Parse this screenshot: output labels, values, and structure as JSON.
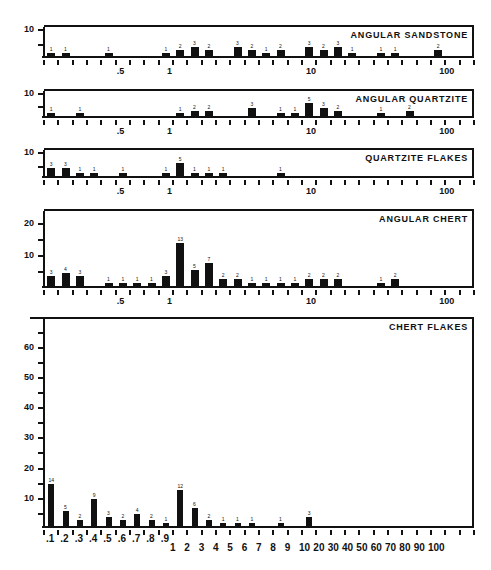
{
  "chart_data": [
    {
      "type": "bar",
      "title": "ANGULAR SANDSTONE",
      "xscale": "log",
      "xtick_labels": [
        ".5",
        "1",
        "10",
        "100"
      ],
      "ylim": [
        0,
        10
      ],
      "yticks": [
        "10"
      ],
      "bars": [
        {
          "slot": 0,
          "value": 1
        },
        {
          "slot": 1,
          "value": 1
        },
        {
          "slot": 4,
          "value": 1
        },
        {
          "slot": 8,
          "value": 1
        },
        {
          "slot": 9,
          "value": 2
        },
        {
          "slot": 10,
          "value": 3
        },
        {
          "slot": 11,
          "value": 2
        },
        {
          "slot": 13,
          "value": 3
        },
        {
          "slot": 14,
          "value": 2
        },
        {
          "slot": 15,
          "value": 1
        },
        {
          "slot": 16,
          "value": 2
        },
        {
          "slot": 18,
          "value": 3
        },
        {
          "slot": 19,
          "value": 2
        },
        {
          "slot": 20,
          "value": 3
        },
        {
          "slot": 21,
          "value": 1
        },
        {
          "slot": 23,
          "value": 1
        },
        {
          "slot": 24,
          "value": 1
        },
        {
          "slot": 27,
          "value": 2
        }
      ]
    },
    {
      "type": "bar",
      "title": "ANGULAR QUARTZITE",
      "xscale": "log",
      "xtick_labels": [
        ".5",
        "1",
        "10",
        "100"
      ],
      "ylim": [
        0,
        10
      ],
      "yticks": [
        "10"
      ],
      "bars": [
        {
          "slot": 0,
          "value": 1
        },
        {
          "slot": 2,
          "value": 1
        },
        {
          "slot": 9,
          "value": 1
        },
        {
          "slot": 10,
          "value": 2
        },
        {
          "slot": 11,
          "value": 2
        },
        {
          "slot": 14,
          "value": 3
        },
        {
          "slot": 16,
          "value": 1
        },
        {
          "slot": 17,
          "value": 1
        },
        {
          "slot": 18,
          "value": 5
        },
        {
          "slot": 19,
          "value": 3
        },
        {
          "slot": 20,
          "value": 2
        },
        {
          "slot": 23,
          "value": 1
        },
        {
          "slot": 25,
          "value": 2
        }
      ]
    },
    {
      "type": "bar",
      "title": "QUARTZITE FLAKES",
      "xscale": "log",
      "xtick_labels": [
        ".5",
        "1",
        "10",
        "100"
      ],
      "ylim": [
        0,
        10
      ],
      "yticks": [
        "10"
      ],
      "bars": [
        {
          "slot": 0,
          "value": 3
        },
        {
          "slot": 1,
          "value": 3
        },
        {
          "slot": 2,
          "value": 1
        },
        {
          "slot": 3,
          "value": 1
        },
        {
          "slot": 5,
          "value": 1
        },
        {
          "slot": 8,
          "value": 1
        },
        {
          "slot": 9,
          "value": 5
        },
        {
          "slot": 10,
          "value": 1
        },
        {
          "slot": 11,
          "value": 1
        },
        {
          "slot": 12,
          "value": 1
        },
        {
          "slot": 16,
          "value": 1
        }
      ]
    },
    {
      "type": "bar",
      "title": "ANGULAR CHERT",
      "xscale": "log",
      "xtick_labels": [
        ".5",
        "1",
        "10",
        "100"
      ],
      "ylim": [
        0,
        24
      ],
      "yticks": [
        "20",
        "10"
      ],
      "bars": [
        {
          "slot": 0,
          "value": 3
        },
        {
          "slot": 1,
          "value": 4
        },
        {
          "slot": 2,
          "value": 3
        },
        {
          "slot": 4,
          "value": 1
        },
        {
          "slot": 5,
          "value": 1
        },
        {
          "slot": 6,
          "value": 1
        },
        {
          "slot": 7,
          "value": 1
        },
        {
          "slot": 8,
          "value": 3
        },
        {
          "slot": 9,
          "value": 13
        },
        {
          "slot": 10,
          "value": 5
        },
        {
          "slot": 11,
          "value": 7
        },
        {
          "slot": 12,
          "value": 2
        },
        {
          "slot": 13,
          "value": 2
        },
        {
          "slot": 14,
          "value": 1
        },
        {
          "slot": 15,
          "value": 1
        },
        {
          "slot": 16,
          "value": 1
        },
        {
          "slot": 17,
          "value": 1
        },
        {
          "slot": 18,
          "value": 2
        },
        {
          "slot": 19,
          "value": 2
        },
        {
          "slot": 20,
          "value": 2
        },
        {
          "slot": 23,
          "value": 1
        },
        {
          "slot": 24,
          "value": 2
        }
      ]
    },
    {
      "type": "bar",
      "title": "CHERT FLAKES",
      "xscale": "log",
      "xtick_labels": [
        ".1",
        ".2",
        ".3",
        ".4",
        ".5",
        ".6",
        ".7",
        ".8",
        ".9",
        "1",
        "2",
        "3",
        "4",
        "5",
        "6",
        "7",
        "8",
        "9",
        "10",
        "20",
        "30",
        "40",
        "50",
        "60",
        "70",
        "80",
        "90",
        "100"
      ],
      "ylim": [
        0,
        70
      ],
      "yticks": [
        "60",
        "50",
        "40",
        "30",
        "20",
        "10"
      ],
      "bars": [
        {
          "slot": 0,
          "value": 14
        },
        {
          "slot": 1,
          "value": 5
        },
        {
          "slot": 2,
          "value": 2
        },
        {
          "slot": 3,
          "value": 9
        },
        {
          "slot": 4,
          "value": 3
        },
        {
          "slot": 5,
          "value": 2
        },
        {
          "slot": 6,
          "value": 4
        },
        {
          "slot": 7,
          "value": 2
        },
        {
          "slot": 8,
          "value": 1
        },
        {
          "slot": 9,
          "value": 12
        },
        {
          "slot": 10,
          "value": 6
        },
        {
          "slot": 11,
          "value": 2
        },
        {
          "slot": 12,
          "value": 1
        },
        {
          "slot": 13,
          "value": 1
        },
        {
          "slot": 14,
          "value": 1
        },
        {
          "slot": 16,
          "value": 1
        },
        {
          "slot": 18,
          "value": 3
        }
      ]
    }
  ]
}
